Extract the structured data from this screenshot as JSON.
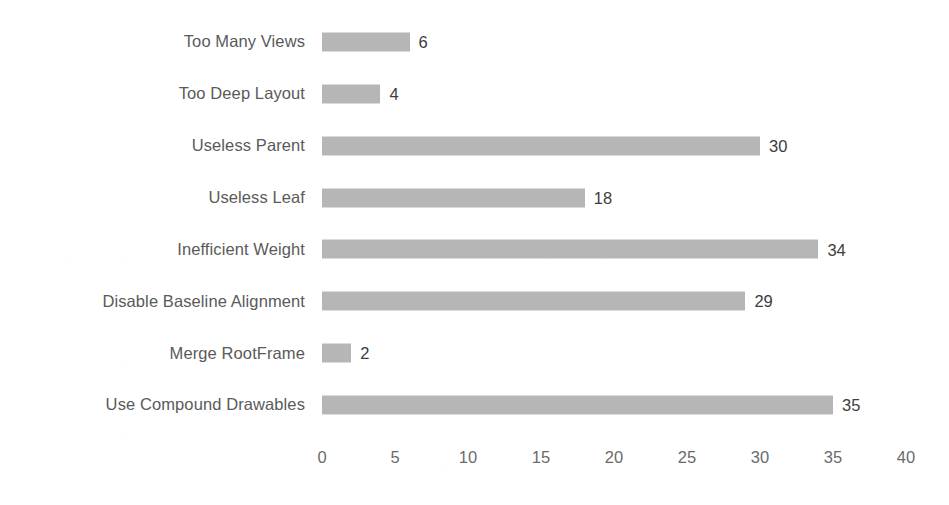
{
  "chart_data": {
    "type": "bar",
    "orientation": "horizontal",
    "title": "",
    "subtitle": "",
    "xlabel": "",
    "ylabel": "",
    "xlim": [
      0,
      40
    ],
    "xticks": [
      "0",
      "5",
      "10",
      "15",
      "20",
      "25",
      "30",
      "35",
      "40"
    ],
    "grid": false,
    "legend": false,
    "legend_position": "none",
    "data_labels": true,
    "bar_color": "#b2b2b2",
    "label_color": "#5a5a5a",
    "value_label_color": "#3d3d3d",
    "background_color": "#ffffff",
    "categories": [
      "Too Many Views",
      "Too Deep Layout",
      "Useless Parent",
      "Useless Leaf",
      "Inefficient Weight",
      "Disable Baseline Alignment",
      "Merge RootFrame",
      "Use Compound Drawables"
    ],
    "values": [
      6,
      4,
      30,
      18,
      34,
      29,
      2,
      35
    ],
    "value_labels": [
      "6",
      "4",
      "30",
      "18",
      "34",
      "29",
      "2",
      "35"
    ]
  }
}
